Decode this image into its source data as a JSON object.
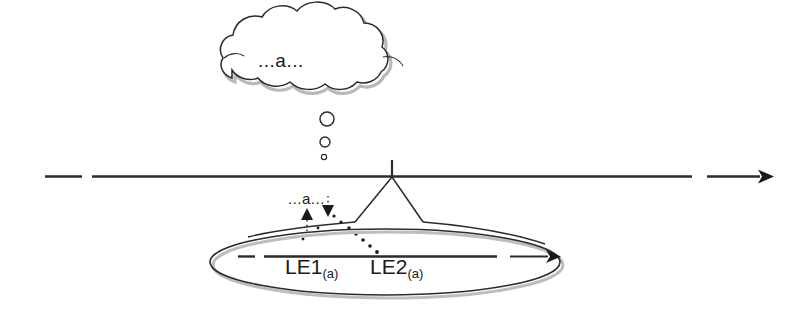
{
  "diagram": {
    "colors": {
      "stroke": "#1a1a1a",
      "shadow": "#aaaaaa",
      "background": "#ffffff",
      "text": "#1a1a1a"
    },
    "cloud": {
      "name": "thought-cloud",
      "text": "...a..."
    },
    "thought_bubbles": [
      {
        "name": "thought-bubble-large",
        "cx": 327,
        "cy": 119,
        "r": 7
      },
      {
        "name": "thought-bubble-medium",
        "cx": 325,
        "cy": 142,
        "r": 5
      },
      {
        "name": "thought-bubble-small",
        "cx": 324,
        "cy": 157,
        "r": 2.6
      }
    ],
    "timeline": {
      "name": "main-timeline-arrow",
      "label": "",
      "y": 176,
      "x_start": 45,
      "x_end": 765,
      "dash_gap_x": 88,
      "arrow_gap_x": 700
    },
    "tent": {
      "name": "tent-peak",
      "apex_x": 392,
      "apex_top_y": 160,
      "left_foot_x": 355,
      "right_foot_x": 423,
      "foot_y": 222
    },
    "inner_text": "...a...",
    "markers": {
      "up_arrow_name": "up-triangle-marker",
      "down_arrow_name": "down-triangle-marker"
    },
    "ellipse": {
      "name": "event-ellipse",
      "cx": 385,
      "cy": 262,
      "rx": 175,
      "ry": 33
    },
    "inner_arrow": {
      "name": "inner-timeline-arrow",
      "y": 256,
      "x_start": 238,
      "x_end": 555,
      "dash_gap_x": 258,
      "arrow_gap_x": 505
    },
    "labels": {
      "le1": {
        "name": "le1-label",
        "main": "LE1",
        "sub": "(a)"
      },
      "le2": {
        "name": "le2-label",
        "main": "LE2",
        "sub": "(a)"
      }
    }
  }
}
